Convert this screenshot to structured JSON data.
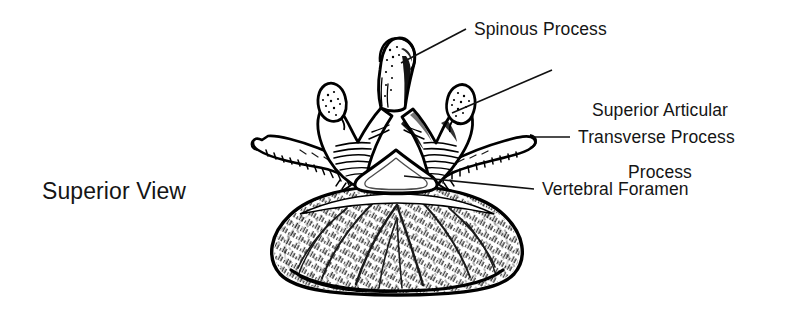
{
  "figure": {
    "background_color": "#ffffff",
    "ink_color": "#000000",
    "text_color": "#151515"
  },
  "view_label": {
    "text": "Superior View"
  },
  "labels": {
    "spinous_process": "Spinous Process",
    "superior_articular_process_line1": "Superior Articular",
    "superior_articular_process_line2": "Process",
    "transverse_process": "Transverse Process",
    "vertebral_foramen": "Vertebral Foramen"
  },
  "anatomy": {
    "parts": [
      "spinous process",
      "superior articular process",
      "transverse process",
      "vertebral foramen",
      "vertebral body",
      "lamina",
      "pedicle"
    ]
  }
}
